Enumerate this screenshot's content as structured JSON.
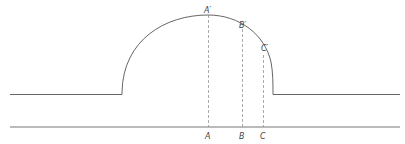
{
  "diagram": {
    "labels": {
      "A_prime": "A′",
      "B_prime": "B′",
      "C_prime": "C′",
      "A": "A",
      "B": "B",
      "C": "C"
    },
    "colors": {
      "stroke": "#555555",
      "dash": "#888888",
      "background": "#ffffff"
    }
  }
}
